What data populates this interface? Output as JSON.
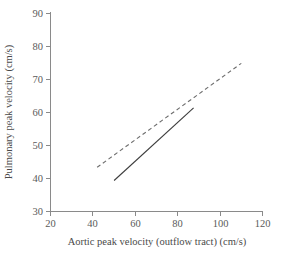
{
  "chart_data": {
    "type": "line",
    "title": "",
    "xlabel": "Aortic peak velocity (outflow tract) (cm/s)",
    "ylabel": "Pulmonary peak velocity (cm/s)",
    "xlim": [
      20,
      120
    ],
    "ylim": [
      30,
      90
    ],
    "xticks": [
      20,
      40,
      60,
      80,
      100,
      120
    ],
    "yticks": [
      30,
      40,
      50,
      60,
      70,
      80,
      90
    ],
    "xtick_labels": [
      "20",
      "40",
      "60",
      "80",
      "100",
      "120"
    ],
    "ytick_labels": [
      "30",
      "40",
      "50",
      "60",
      "70",
      "80",
      "90"
    ],
    "grid": false,
    "legend": "none",
    "series": [
      {
        "name": "dashed-regression-line",
        "style": "dashed",
        "color": "#6e6e6e",
        "x": [
          42,
          110
        ],
        "y": [
          43.4,
          74.9
        ]
      },
      {
        "name": "solid-regression-line",
        "style": "solid",
        "color": "#3c3c3c",
        "x": [
          50,
          87.5
        ],
        "y": [
          39.4,
          61.4
        ]
      }
    ]
  },
  "figure": {
    "background_color": "#ffffff",
    "axis_color": "#8a8a8a",
    "text_color": "#4a4a4a"
  }
}
